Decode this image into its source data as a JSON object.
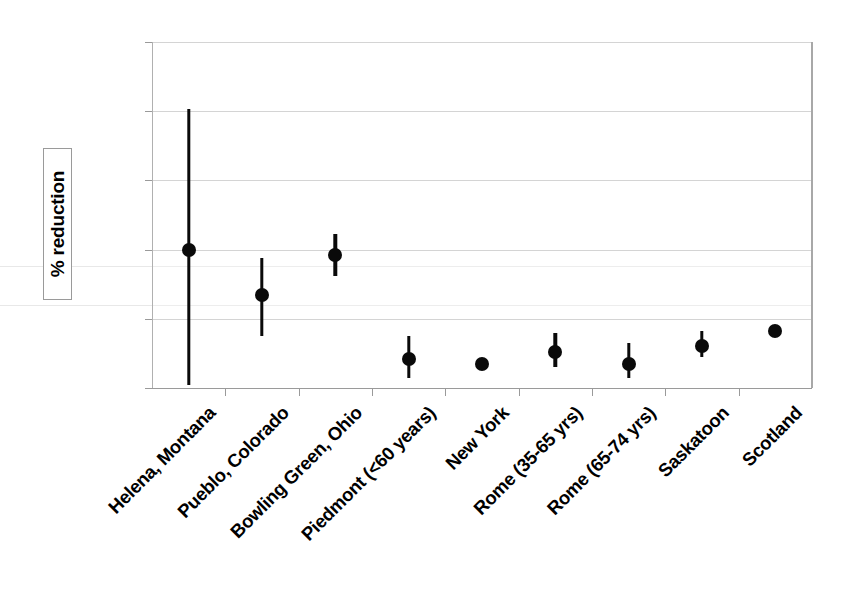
{
  "chart_data": {
    "type": "scatter",
    "title": "",
    "xlabel": "",
    "ylabel": "% reduction",
    "ylim": [
      0,
      100
    ],
    "yticks": [
      0,
      20,
      40,
      60,
      80,
      100
    ],
    "grid": true,
    "legend": "none",
    "error_bars": "vertical",
    "categories": [
      "Helena, Montana",
      "Pueblo, Colorado",
      "Bowling Green, Ohio",
      "Piedmont (<60 years)",
      "New York",
      "Rome (35-65 yrs)",
      "Rome (65-74 yrs)",
      "Saskatoon",
      "Scotland"
    ],
    "values": [
      40,
      27,
      38.5,
      8.5,
      7,
      10.5,
      7,
      12,
      16.5
    ],
    "ci_low": [
      1,
      15,
      32.5,
      3,
      7,
      6,
      3,
      9,
      16.5
    ],
    "ci_high": [
      80.5,
      37.5,
      44.5,
      15,
      7,
      16,
      13,
      16.5,
      16.5
    ],
    "points": [
      {
        "label": "Helena, Montana",
        "value": 40,
        "low": 1,
        "high": 80.5,
        "has_error_bar": true
      },
      {
        "label": "Pueblo, Colorado",
        "value": 27,
        "low": 15,
        "high": 37.5,
        "has_error_bar": true
      },
      {
        "label": "Bowling Green, Ohio",
        "value": 38.5,
        "low": 32.5,
        "high": 44.5,
        "has_error_bar": true
      },
      {
        "label": "Piedmont (<60 years)",
        "value": 8.5,
        "low": 3,
        "high": 15,
        "has_error_bar": true
      },
      {
        "label": "New York",
        "value": 7,
        "low": 7,
        "high": 7,
        "has_error_bar": false
      },
      {
        "label": "Rome (35-65 yrs)",
        "value": 10.5,
        "low": 6,
        "high": 16,
        "has_error_bar": true
      },
      {
        "label": "Rome (65-74 yrs)",
        "value": 7,
        "low": 3,
        "high": 13,
        "has_error_bar": true
      },
      {
        "label": "Saskatoon",
        "value": 12,
        "low": 9,
        "high": 16.5,
        "has_error_bar": true
      },
      {
        "label": "Scotland",
        "value": 16.5,
        "low": 16.5,
        "high": 16.5,
        "has_error_bar": false
      }
    ],
    "colors": {
      "marker": "#0a0a0a",
      "error_bar": "#0a0a0a",
      "grid": "#d4d4d4",
      "axis": "#9a9a9a",
      "background": "#ffffff"
    }
  }
}
